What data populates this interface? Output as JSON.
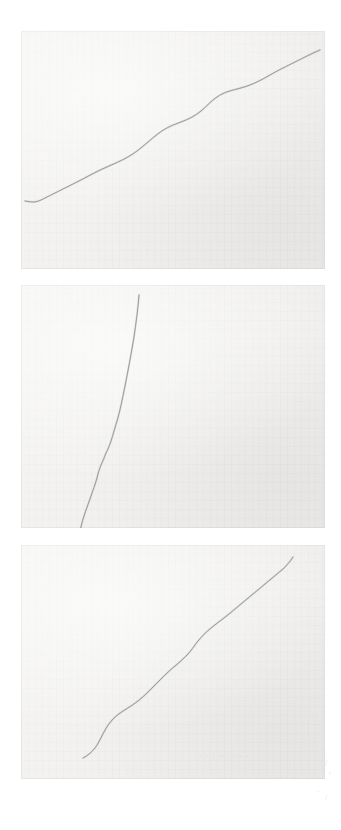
{
  "document": {
    "kind": "scanned-plate",
    "page_background": "#ffffff",
    "width": 341,
    "height": 830,
    "panel_count": 3
  },
  "panels": [
    {
      "id": "panel-1",
      "label": "top-panel",
      "x": 21,
      "y": 31,
      "width": 304,
      "height": 238,
      "paper_color": "#f2f1ef",
      "line_color": "#8d8f92",
      "description": "gently rising wavy line from lower left to upper right",
      "curve": "M 4,170 C 10,171 14,172 20,169 C 30,164 42,158 54,152 C 66,146 76,140 88,135 C 100,130 108,126 116,120 C 124,114 130,108 138,102 C 146,96 152,94 160,91 C 168,88 174,85 180,80 C 186,75 190,70 196,66 C 203,61 209,60 216,58 C 224,56 230,54 238,50 C 246,46 252,42 260,38 C 268,34 276,30 284,26 C 290,23 294,21 299,19"
    },
    {
      "id": "panel-2",
      "label": "middle-panel",
      "x": 21,
      "y": 285,
      "width": 304,
      "height": 243,
      "paper_color": "#f2f1ef",
      "line_color": "#8d8f92",
      "description": "near-vertical descending line that bends left and hooks at the bottom",
      "curve": "M 118,10 C 117,24 115,38 113,52 C 110,70 107,86 104,101 C 101,116 99,126 96,136 C 93,146 92,150 90,156 C 88,162 87,164 85,168 C 83,173 82,176 80,180 C 78,185 77,188 76,193 C 74,200 72,205 70,211 C 68,217 66,222 64,228 C 62,234 61,237 60,242 C 59,248 59,251 60,254 C 61,257 63,259 65,260 C 67,261 70,261 72,260"
    },
    {
      "id": "panel-3",
      "label": "bottom-panel",
      "x": 21,
      "y": 545,
      "width": 304,
      "height": 234,
      "paper_color": "#f2f1ef",
      "line_color": "#8d8f92",
      "description": "S-curved line rising from lower left to upper right with a steeper final segment",
      "curve": "M 62,213 C 66,211 70,208 74,203 C 78,198 80,192 83,187 C 86,181 89,177 93,173 C 98,168 104,165 110,161 C 116,157 121,153 126,148 C 131,143 135,139 140,134 C 145,129 149,125 154,121 C 159,117 162,114 166,110 C 170,106 173,101 177,96 C 181,91 185,87 190,83 C 196,78 202,74 208,69 C 214,64 220,59 226,54 C 232,49 238,44 244,39 C 250,34 256,29 262,24 C 266,20 269,17 272,12"
    }
  ],
  "annotations": {
    "panel3_smudge": ". . .  ...  . . .",
    "margin_marks": [
      "/",
      "'",
      ".",
      "/"
    ]
  }
}
